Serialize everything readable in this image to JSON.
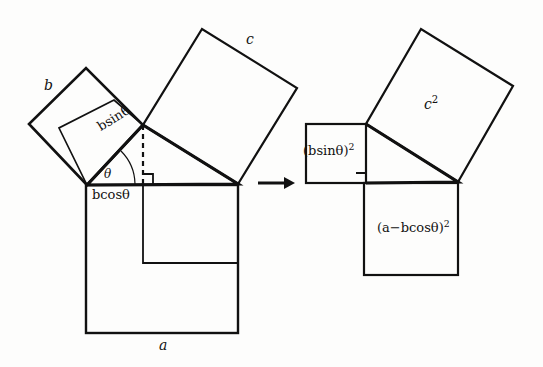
{
  "figure": {
    "background_color": "#fdfdfc",
    "stroke_color": "#111111",
    "arrow": {
      "name": "transformation-arrow",
      "direction": "right"
    }
  },
  "left_panel": {
    "name": "before-transformation",
    "labels": {
      "side_b": "b",
      "side_c": "c",
      "side_a": "a",
      "b_sin_theta": "bsinθ",
      "b_cos_theta": "bcosθ",
      "theta": "θ"
    },
    "shapes": [
      {
        "name": "square-on-side-b",
        "type": "square",
        "label": "b"
      },
      {
        "name": "square-on-side-c",
        "type": "square",
        "label": "c"
      },
      {
        "name": "square-on-side-a",
        "type": "square",
        "label": "a"
      },
      {
        "name": "inner-square-b-projection",
        "type": "square",
        "label": ""
      },
      {
        "name": "inner-rectangle-a-projection",
        "type": "rectangle",
        "label": ""
      },
      {
        "name": "triangle-abc",
        "type": "triangle",
        "label": ""
      },
      {
        "name": "altitude-dashed-line",
        "type": "dashed-line",
        "label": ""
      },
      {
        "name": "right-angle-mark",
        "type": "square-mark",
        "label": ""
      },
      {
        "name": "angle-arc-theta",
        "type": "arc",
        "label": "θ"
      }
    ]
  },
  "right_panel": {
    "name": "after-transformation",
    "labels": {
      "c_squared_base": "c",
      "c_squared_exponent": "2",
      "b_sin_theta_squared": "(bsinθ)",
      "b_sin_theta_squared_exponent": "2",
      "a_minus_b_cos_theta_squared": "(a−bcosθ)",
      "a_minus_b_cos_theta_squared_exponent": "2"
    },
    "shapes": [
      {
        "name": "square-c-squared",
        "type": "square",
        "label": "c²"
      },
      {
        "name": "square-bsin-theta-squared",
        "type": "square",
        "label": "(bsinθ)²"
      },
      {
        "name": "square-a-minus-bcos-theta-squared",
        "type": "square",
        "label": "(a−bcosθ)²"
      },
      {
        "name": "triangle-abc-right",
        "type": "triangle",
        "label": ""
      },
      {
        "name": "right-angle-mark-right",
        "type": "square-mark",
        "label": ""
      }
    ]
  },
  "equation_meaning": {
    "relation": "c² = (bsinθ)² + (a−bcosθ)²"
  }
}
